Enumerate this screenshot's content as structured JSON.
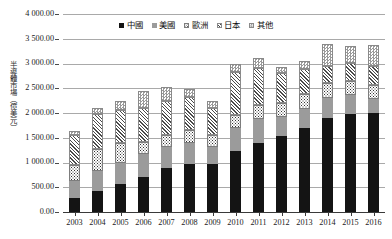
{
  "chart_data": {
    "type": "bar",
    "subtype": "stacked-column",
    "title": "",
    "xlabel": "",
    "ylabel": "半導體市場（億美元）",
    "ylim": [
      0,
      4000
    ],
    "ytick_step": 500,
    "ytick_labels": [
      "4 000.00",
      "3 500.00",
      "3 000.00",
      "2 500.00",
      "2 000.00",
      "1 500.00",
      "1 000.00",
      "500.00",
      "0.00"
    ],
    "ytick_values": [
      4000,
      3500,
      3000,
      2500,
      2000,
      1500,
      1000,
      500,
      0
    ],
    "grid": true,
    "grid_axis": "y",
    "legend_position": "top-center",
    "categories": [
      "2003",
      "2004",
      "2005",
      "2006",
      "2007",
      "2008",
      "2009",
      "2010",
      "2011",
      "2012",
      "2013",
      "2014",
      "2015",
      "2016"
    ],
    "series": [
      {
        "name": "中國",
        "pattern": "solid-black",
        "color": "#141414",
        "values": [
          290,
          420,
          560,
          710,
          880,
          980,
          970,
          1240,
          1400,
          1540,
          1700,
          1900,
          1980,
          2000
        ]
      },
      {
        "name": "美國",
        "pattern": "solid-gray",
        "color": "#9b9b9b",
        "values": [
          340,
          400,
          430,
          460,
          430,
          410,
          340,
          460,
          480,
          380,
          390,
          400,
          390,
          280
        ]
      },
      {
        "name": "歐洲",
        "pattern": "dotted",
        "color": "#ffffff",
        "values": [
          310,
          450,
          400,
          240,
          250,
          260,
          240,
          270,
          290,
          290,
          290,
          300,
          270,
          280
        ]
      },
      {
        "name": "日本",
        "pattern": "diagonal-hatch",
        "color": "#ffffff",
        "values": [
          620,
          720,
          680,
          700,
          680,
          670,
          550,
          860,
          730,
          600,
          500,
          350,
          370,
          380
        ]
      },
      {
        "name": "其他",
        "pattern": "checkered",
        "color": "#ffffff",
        "values": [
          80,
          110,
          180,
          340,
          280,
          170,
          150,
          170,
          220,
          120,
          170,
          440,
          340,
          440
        ]
      }
    ],
    "totals": [
      1640,
      2100,
      2250,
      2450,
      2520,
      2490,
      2250,
      3000,
      3120,
      2930,
      3050,
      3390,
      3350,
      3380
    ]
  },
  "legend": {
    "items": [
      {
        "label": "中國",
        "swatch": "s-china"
      },
      {
        "label": "美國",
        "swatch": "s-usa"
      },
      {
        "label": "歐洲",
        "swatch": "s-europe"
      },
      {
        "label": "日本",
        "swatch": "s-japan"
      },
      {
        "label": "其他",
        "swatch": "s-other"
      }
    ]
  }
}
